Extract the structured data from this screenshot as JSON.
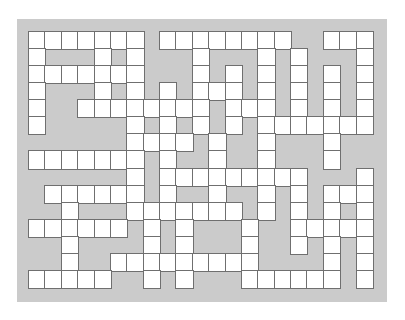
{
  "puzzle": {
    "type": "crossword-grid",
    "columns": 21,
    "rows": 15,
    "colors": {
      "background": "#ffffff",
      "panel": "#cbcbcb",
      "open_cell": "#ffffff",
      "cell_border": "#6f6f6f"
    },
    "legend": {
      "open": "1",
      "block": "0"
    },
    "grid": [
      "111111101111111100111",
      "100010100010001010001",
      "111111100010101010101",
      "100010101011101010101",
      "100111111110111010101",
      "100000101010101111111",
      "000000111101001000100",
      "111111101001001000100",
      "000000101111111110001",
      "011111101001001010111",
      "001000111111101010101",
      "111111010100010011111",
      "001000010100010010101",
      "001001111111110000101",
      "111110010100011111101"
    ]
  }
}
